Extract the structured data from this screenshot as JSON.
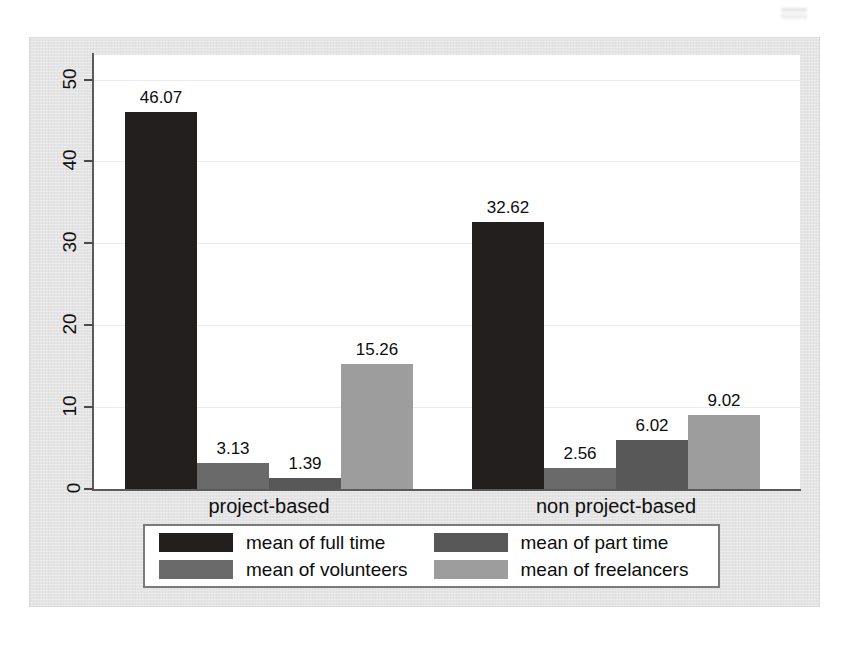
{
  "chart_data": {
    "type": "bar",
    "title": "",
    "subtitle": "",
    "xlabel": "",
    "ylabel": "",
    "categories": [
      "project-based",
      "non project-based"
    ],
    "series": [
      {
        "name": "mean of full time",
        "values": [
          46.07,
          32.62
        ],
        "color": "#231f1e"
      },
      {
        "name": "mean of volunteers",
        "values": [
          3.13,
          2.56
        ],
        "color": "#6a6a6a"
      },
      {
        "name": "mean of part time",
        "values": [
          1.39,
          6.02
        ],
        "color": "#575757"
      },
      {
        "name": "mean of freelancers",
        "values": [
          15.26,
          9.02
        ],
        "color": "#9d9d9d"
      }
    ],
    "series_draw_order": [
      "mean of full time",
      "mean of volunteers",
      "mean of part time",
      "mean of freelancers"
    ],
    "value_labels": [
      "46.07",
      "3.13",
      "1.39",
      "15.26",
      "32.62",
      "2.56",
      "6.02",
      "9.02"
    ],
    "yticks": [
      0,
      10,
      20,
      30,
      40,
      50
    ],
    "ytick_labels": [
      "0",
      "10",
      "20",
      "30",
      "40",
      "50"
    ],
    "ylim": [
      0,
      53
    ],
    "grid": "horizontal",
    "grid_color": "#ebebeb",
    "legend_position": "bottom",
    "legend_columns": 2,
    "bar_gap": 0,
    "plot_background": "#ffffff",
    "figure_background": "#e4e4e4",
    "axis_color": "#5a5a5a"
  },
  "legend": {
    "entries": [
      {
        "label": "mean of full time",
        "color": "#231f1e"
      },
      {
        "label": "mean of part time",
        "color": "#575757"
      },
      {
        "label": "mean of volunteers",
        "color": "#6a6a6a"
      },
      {
        "label": "mean of freelancers",
        "color": "#9d9d9d"
      }
    ]
  }
}
